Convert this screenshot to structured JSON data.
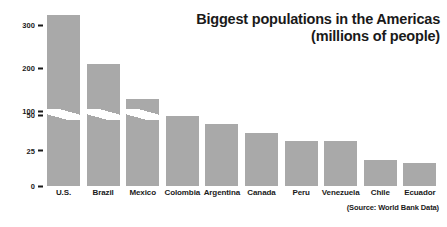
{
  "chart_data": {
    "type": "bar",
    "title": "Biggest populations in the Americas (millions of people)",
    "title_line1": "Biggest populations in the Americas",
    "title_line2": "(millions of people)",
    "xlabel": "",
    "ylabel": "",
    "categories": [
      "U.S.",
      "Brazil",
      "Mexico",
      "Colombia",
      "Argentina",
      "Canada",
      "Peru",
      "Venezuela",
      "Chile",
      "Ecuador"
    ],
    "values": [
      325,
      209,
      129,
      49,
      44,
      37,
      32,
      32,
      18,
      16
    ],
    "tick_labels": [
      "300",
      "200",
      "100",
      "50",
      "25",
      "0"
    ],
    "tick_values": [
      300,
      200,
      100,
      50,
      25,
      0
    ],
    "axis_break": {
      "between": [
        50,
        100
      ],
      "note": "broken y-axis: scale changes above 50"
    },
    "ylim": [
      0,
      350
    ],
    "grid": false,
    "legend": false,
    "bar_color": "#a9a9a9",
    "source": "(Source: World Bank Data)"
  },
  "colors": {
    "bar": "#a9a9a9",
    "text": "#1a1a1a",
    "background": "#ffffff"
  }
}
